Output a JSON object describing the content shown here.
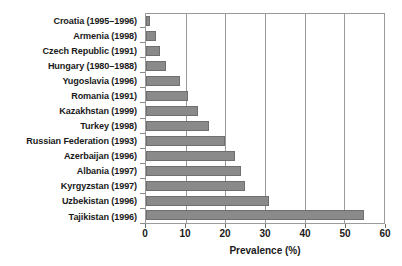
{
  "chart_data": {
    "type": "bar",
    "orientation": "horizontal",
    "title": "",
    "xlabel": "Prevalence (%)",
    "ylabel": "",
    "xlim": [
      0,
      60
    ],
    "xticks": [
      0,
      10,
      20,
      30,
      40,
      50,
      60
    ],
    "xtick_labels": [
      "0",
      "10",
      "20",
      "30",
      "40",
      "50",
      "60"
    ],
    "grid": "vertical",
    "legend": "none",
    "bar_color": "#8a8a8a",
    "categories": [
      "Croatia (1995–1996)",
      "Armenia (1998)",
      "Czech Republic (1991)",
      "Hungary (1980–1988)",
      "Yugoslavia (1996)",
      "Romania (1991)",
      "Kazakhstan (1999)",
      "Turkey (1998)",
      "Russian Federation (1993)",
      "Azerbaijan (1996)",
      "Albania (1997)",
      "Kyrgyzstan (1997)",
      "Uzbekistan (1996)",
      "Tajikistan (1996)"
    ],
    "values": [
      1,
      2.5,
      3.5,
      5,
      8.5,
      10.5,
      13,
      16,
      20,
      22.5,
      24,
      25,
      31,
      55
    ]
  }
}
